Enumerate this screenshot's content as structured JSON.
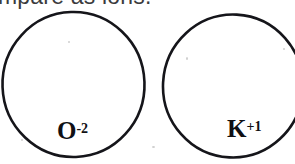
{
  "page": {
    "background_color": "#ffffff",
    "ink_color": "#15151a",
    "width": 295,
    "height": 164
  },
  "instruction": {
    "text": "mpare as ions.",
    "note": "top of line cropped off by image edge",
    "color": "#3b3b3d"
  },
  "diagram": {
    "type": "ion-size-comparison",
    "circles": [
      {
        "id": "oxide-circle",
        "cx": 73,
        "cy": 85,
        "r": 72,
        "stroke": "#15151a",
        "fill": "#ffffff"
      },
      {
        "id": "potassium-circle",
        "cx": 233,
        "cy": 86,
        "r": 71,
        "stroke": "#15151a",
        "fill": "#ffffff"
      }
    ],
    "labels": [
      {
        "id": "oxide",
        "symbol": "O",
        "charge": "-2",
        "full": "O-2"
      },
      {
        "id": "potassium",
        "symbol": "K",
        "charge": "+1",
        "full": "K+1"
      }
    ]
  }
}
